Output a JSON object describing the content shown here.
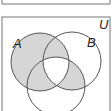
{
  "diagram": {
    "type": "venn-3-set",
    "universe_label": "U",
    "sets": [
      {
        "label": "A",
        "cx": 40,
        "cy": 62,
        "r": 29
      },
      {
        "label": "B",
        "cx": 72,
        "cy": 61,
        "r": 29
      },
      {
        "label": "C",
        "cx": 56,
        "cy": 86,
        "r": 29
      }
    ],
    "shaded_regions": [
      "A only",
      "A∩B only",
      "A∩C only",
      "B∩C only"
    ],
    "unshaded_regions": [
      "A∩B∩C",
      "B only",
      "C only",
      "outside"
    ],
    "colors": {
      "shade": "#d6d6d6",
      "stroke": "#555555",
      "frame": "#777777",
      "background": "#ffffff"
    }
  }
}
